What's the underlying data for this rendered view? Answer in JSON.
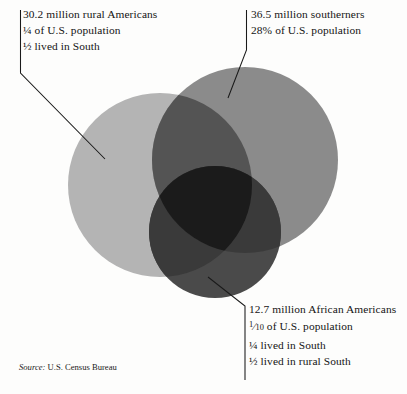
{
  "figure": {
    "type": "venn-diagram",
    "sets": [
      {
        "id": "rural-americans",
        "label": "30.2 million rural Americans",
        "lines": [
          "30.2 million rural Americans",
          "¼ of U.S. population",
          "½ lived in South"
        ],
        "color": "#b4b4b4"
      },
      {
        "id": "southerners",
        "label": "36.5 million southerners",
        "lines": [
          "36.5 million southerners",
          "28% of U.S. population"
        ],
        "color": "#8b8b8b"
      },
      {
        "id": "african-americans",
        "label": "12.7 million African Americans",
        "lines": [
          "12.7 million African Americans",
          "of U.S. population",
          "¼ lived in South",
          "½ lived in rural South"
        ],
        "fraction": {
          "numerator": "1",
          "denominator": "10"
        },
        "color": "#4a4a4a"
      }
    ],
    "overlap_colors": {
      "pair": "#545454",
      "triple": "#1b1b1b"
    }
  },
  "annotations": {
    "rural": {
      "line1": "30.2 million rural Americans",
      "line2": "¼ of U.S. population",
      "line3": "½ lived in South"
    },
    "southerners": {
      "line1": "36.5 million southerners",
      "line2": "28% of U.S. population"
    },
    "african_americans": {
      "line1": "12.7 million African Americans",
      "frac_numerator": "1",
      "frac_bar": "⁄",
      "frac_denominator": "10",
      "line2_rest": " of U.S. population",
      "line3": "¼ lived in South",
      "line4": "½ lived in rural South"
    }
  },
  "source": {
    "label": "Source:",
    "text": " U.S. Census Bureau"
  }
}
